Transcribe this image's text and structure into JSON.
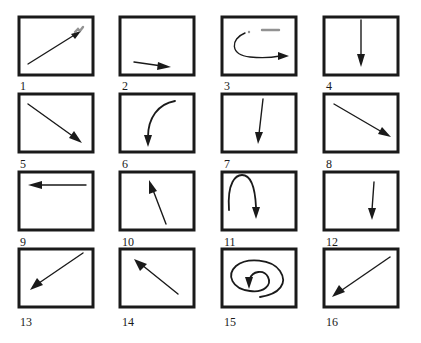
{
  "figure": {
    "stroke_color": "#1a1a1a",
    "background": "#ffffff",
    "panels": [
      {
        "label": "1",
        "gesture": "straight arrow toward upper-right (diagonal up)"
      },
      {
        "label": "2",
        "gesture": "short arrow to the right, slightly downward"
      },
      {
        "label": "3",
        "gesture": "curved arrow sweeping left then right (hook)"
      },
      {
        "label": "4",
        "gesture": "vertical arrow pointing down"
      },
      {
        "label": "5",
        "gesture": "diagonal arrow toward lower-right"
      },
      {
        "label": "6",
        "gesture": "curved arrow from upper-right arcing down"
      },
      {
        "label": "7",
        "gesture": "near-vertical arrow pointing down, slight left tilt"
      },
      {
        "label": "8",
        "gesture": "diagonal arrow toward lower-right"
      },
      {
        "label": "9",
        "gesture": "horizontal arrow pointing left"
      },
      {
        "label": "10",
        "gesture": "arrow pointing up, slightly left"
      },
      {
        "label": "11",
        "gesture": "arch-shaped arrow up and over, ending downward"
      },
      {
        "label": "12",
        "gesture": "short vertical arrow pointing down"
      },
      {
        "label": "13",
        "gesture": "diagonal arrow toward lower-left"
      },
      {
        "label": "14",
        "gesture": "diagonal arrow toward upper-left"
      },
      {
        "label": "15",
        "gesture": "spiral arrow curling inward, ending downward"
      },
      {
        "label": "16",
        "gesture": "diagonal arrow toward lower-left"
      }
    ]
  }
}
